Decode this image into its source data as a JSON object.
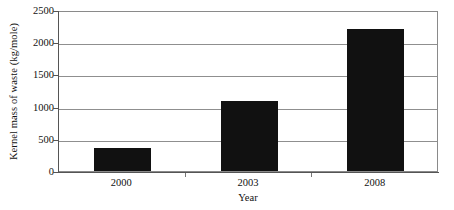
{
  "chart_data": {
    "type": "bar",
    "title": "",
    "categories": [
      "2000",
      "2003",
      "2008"
    ],
    "values": [
      350,
      1080,
      2200
    ],
    "xlabel": "Year",
    "ylabel": "Kernel mass of waste (kg/mole)",
    "ylim": [
      0,
      2500
    ],
    "yticks": [
      0,
      500,
      1000,
      1500,
      2000,
      2500
    ],
    "ytick_labels": [
      "0",
      "500",
      "1000",
      "1500",
      "2000",
      "2500"
    ],
    "grid": true,
    "legend": "none",
    "bar_color": "#111111",
    "grid_color": "#8f8f8f",
    "axis_color": "#555555",
    "frame_color": "#8a8a8a"
  }
}
